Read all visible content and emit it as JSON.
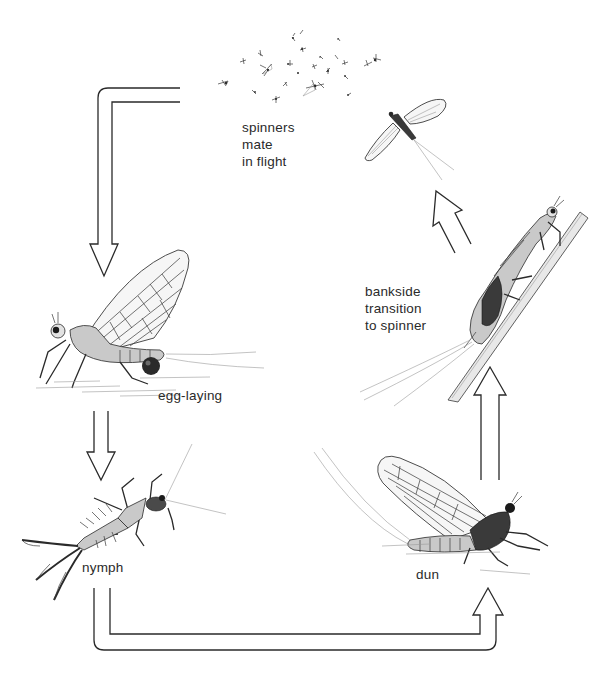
{
  "diagram": {
    "stages": [
      {
        "id": "spinners",
        "label_lines": [
          "spinners",
          "mate",
          "in flight"
        ]
      },
      {
        "id": "egg-laying",
        "label_lines": [
          "egg-laying"
        ]
      },
      {
        "id": "nymph",
        "label_lines": [
          "nymph"
        ]
      },
      {
        "id": "dun",
        "label_lines": [
          "dun"
        ]
      },
      {
        "id": "bankside",
        "label_lines": [
          "bankside",
          "transition",
          "to spinner"
        ]
      }
    ],
    "flow": [
      {
        "from": "spinners",
        "to": "egg-laying"
      },
      {
        "from": "egg-laying",
        "to": "nymph"
      },
      {
        "from": "nymph",
        "to": "dun"
      },
      {
        "from": "dun",
        "to": "bankside"
      },
      {
        "from": "bankside",
        "to": "spinners"
      }
    ],
    "colors": {
      "ink": "#2a2a2a",
      "background": "#ffffff",
      "wing_fill": "#f4f4f4",
      "shade": "#8a8a8a"
    }
  }
}
